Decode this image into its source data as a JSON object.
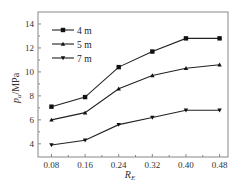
{
  "chart_data": {
    "type": "line",
    "title": "",
    "xlabel": "R_E",
    "xlabel_main": "R",
    "xlabel_sub": "E",
    "ylabel": "p_u/MPa",
    "ylabel_main": "p",
    "ylabel_sub": "u",
    "ylabel_unit": "/MPa",
    "x": [
      0.08,
      0.16,
      0.24,
      0.32,
      0.4,
      0.48
    ],
    "x_tick_labels": [
      "0.08",
      "0.16",
      "0.24",
      "0.32",
      "0.40",
      "0.48"
    ],
    "y_ticks": [
      4,
      6,
      8,
      10,
      12,
      14
    ],
    "y_tick_labels": [
      "4",
      "6",
      "8",
      "10",
      "12",
      "14"
    ],
    "xlim": [
      0.048,
      0.5
    ],
    "ylim": [
      2.9,
      15
    ],
    "grid": false,
    "legend_position": "upper left",
    "series": [
      {
        "name": "4 m",
        "marker": "square",
        "values": [
          7.1,
          7.9,
          10.4,
          11.7,
          12.8,
          12.8
        ]
      },
      {
        "name": "5 m",
        "marker": "triangle-up",
        "values": [
          6.0,
          6.6,
          8.6,
          9.7,
          10.3,
          10.6
        ]
      },
      {
        "name": "7 m",
        "marker": "triangle-down",
        "values": [
          3.9,
          4.3,
          5.6,
          6.2,
          6.8,
          6.8
        ]
      }
    ]
  },
  "colors": {
    "line": "#222222",
    "frame": "#888888",
    "text": "#333333"
  }
}
